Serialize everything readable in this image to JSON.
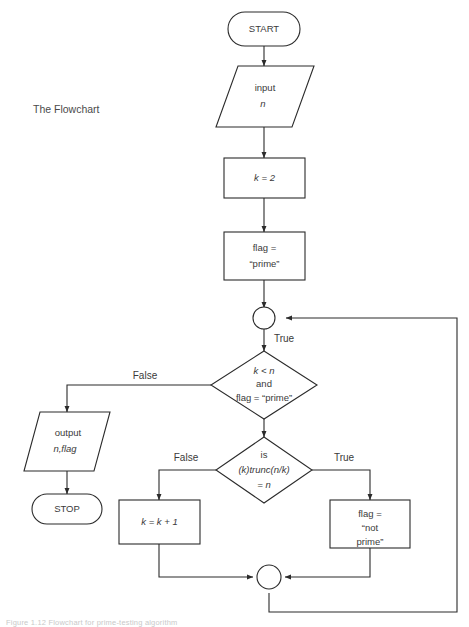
{
  "figure": {
    "side_label": "The Flowchart",
    "caption": "Figure 1.12  Flowchart for prime-testing algorithm"
  },
  "colors": {
    "stroke": "#2b2b2b",
    "text": "#3a3a3a",
    "background": "#ffffff",
    "caption": "#c9c9c9"
  },
  "nodes": {
    "start": {
      "label": "START",
      "shape": "terminator"
    },
    "input": {
      "line1": "input",
      "line2": "n",
      "shape": "parallelogram"
    },
    "init_k": {
      "label": "k = 2",
      "shape": "process"
    },
    "init_flag": {
      "line1": "flag  =",
      "line2": "“prime”",
      "shape": "process"
    },
    "loop_connector": {
      "label": "",
      "shape": "connector"
    },
    "decision_loop": {
      "line1": "k < n",
      "line2": "and",
      "line3": "flag = “prime”",
      "shape": "decision"
    },
    "decision_divides": {
      "line1": "is",
      "line2": "(k)trunc(n/k)",
      "line3": "= n",
      "shape": "decision"
    },
    "output": {
      "line1": "output",
      "line2": "n,flag",
      "shape": "parallelogram"
    },
    "stop": {
      "label": "STOP",
      "shape": "terminator"
    },
    "increment_k": {
      "label": "k = k + 1",
      "shape": "process"
    },
    "set_not_prime": {
      "line1": "flag  =",
      "line2": "“not",
      "line3": "prime”",
      "shape": "process"
    },
    "merge_connector": {
      "label": "",
      "shape": "connector"
    }
  },
  "edge_labels": {
    "loop_true": "True",
    "loop_false": "False",
    "divides_false": "False",
    "divides_true": "True"
  }
}
